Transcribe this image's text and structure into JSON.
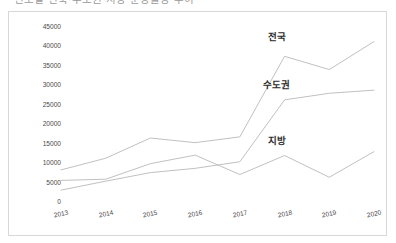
{
  "title": {
    "text": "연도별 전국·수도권·지방 분양물량 추이",
    "note": "cropped at top edge"
  },
  "chart_data": {
    "type": "line",
    "title": "연도별 전국·수도권·지방 분양물량 추이",
    "xlabel": "",
    "ylabel": "",
    "categories": [
      "2013",
      "2014",
      "2015",
      "2016",
      "2017",
      "2018",
      "2019",
      "2020"
    ],
    "ylim": [
      0,
      45000
    ],
    "ytick_values": [
      0,
      5000,
      10000,
      15000,
      20000,
      25000,
      30000,
      35000,
      40000,
      45000
    ],
    "ytick_labels": [
      "0",
      "5000",
      "10000",
      "15000",
      "20000",
      "25000",
      "30000",
      "35000",
      "40000",
      "45000"
    ],
    "grid": false,
    "legend": "inline-labels",
    "line_color": "#b9b9b9",
    "series": [
      {
        "name": "전국",
        "label_x_category": "2018",
        "values": [
          8000,
          11000,
          16200,
          15000,
          16500,
          37200,
          33800,
          41000
        ]
      },
      {
        "name": "수도권",
        "label_x_category": "2018",
        "values": [
          2800,
          5100,
          7300,
          8400,
          10100,
          26000,
          27700,
          28500
        ]
      },
      {
        "name": "지방",
        "label_x_category": "2018",
        "values": [
          5300,
          5600,
          9600,
          11800,
          6800,
          11700,
          6100,
          12700
        ]
      }
    ]
  },
  "series_labels": [
    {
      "name": "전국",
      "text": "전국"
    },
    {
      "name": "수도권",
      "text": "수도권"
    },
    {
      "name": "지방",
      "text": "지방"
    }
  ]
}
